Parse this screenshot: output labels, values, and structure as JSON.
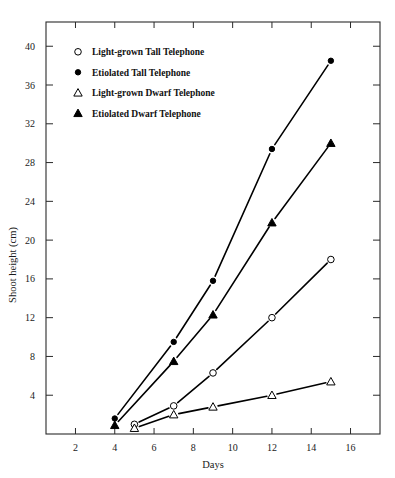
{
  "chart_data": {
    "type": "line",
    "title": "",
    "xlabel": "Days",
    "ylabel": "Shoot height (cm)",
    "xlim": [
      0.5,
      17.5
    ],
    "ylim": [
      0,
      42.5
    ],
    "xticks": [
      2,
      4,
      6,
      8,
      10,
      12,
      14,
      16
    ],
    "yticks": [
      4,
      8,
      12,
      16,
      20,
      24,
      28,
      32,
      36,
      40
    ],
    "grid": false,
    "legend_position": "upper-left-inside",
    "series": [
      {
        "name": "Light-grown Tall Telephone",
        "marker": "open-circle",
        "x": [
          5,
          7,
          9,
          12,
          15
        ],
        "y": [
          1.0,
          2.9,
          6.3,
          12.0,
          18.0
        ]
      },
      {
        "name": "Etiolated Tall Telephone",
        "marker": "filled-circle",
        "x": [
          4,
          7,
          9,
          12,
          15
        ],
        "y": [
          1.6,
          9.5,
          15.8,
          29.4,
          38.5
        ]
      },
      {
        "name": "Light-grown Dwarf Telephone",
        "marker": "open-triangle",
        "x": [
          5,
          7,
          9,
          12,
          15
        ],
        "y": [
          0.6,
          2.0,
          2.8,
          4.0,
          5.4
        ]
      },
      {
        "name": "Etiolated Dwarf Telephone",
        "marker": "filled-triangle",
        "x": [
          4,
          7,
          9,
          12,
          15
        ],
        "y": [
          0.9,
          7.5,
          12.3,
          21.8,
          30.0
        ]
      }
    ]
  },
  "legend": {
    "entries": [
      {
        "marker": "open-circle",
        "label": "Light-grown Tall Telephone"
      },
      {
        "marker": "filled-circle",
        "label": "Etiolated Tall Telephone"
      },
      {
        "marker": "open-triangle",
        "label": "Light-grown Dwarf Telephone"
      },
      {
        "marker": "filled-triangle",
        "label": "Etiolated Dwarf Telephone"
      }
    ]
  },
  "colors": {
    "axis": "#2a2a2a",
    "line": "#000000",
    "marker_fill": "#000000",
    "marker_open": "#ffffff",
    "background": "#ffffff"
  }
}
